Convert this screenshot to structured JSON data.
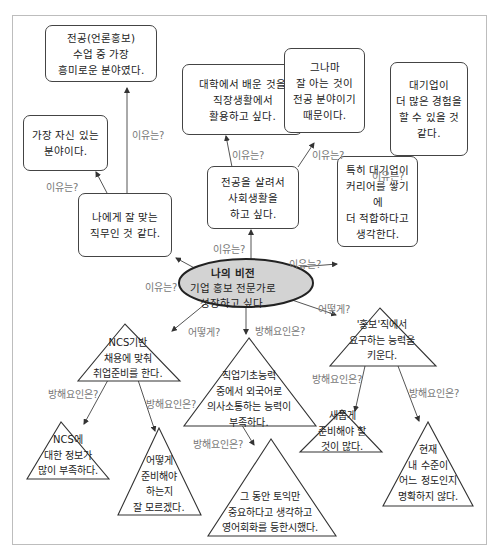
{
  "center": {
    "title": "나의 비전",
    "text": "기업 홍보 전문가로\n성장하고 싶다.",
    "fill": "#d3d3d3"
  },
  "labels": {
    "reason": "이유는?",
    "how": "어떻게?",
    "obstacle": "방해요인은?"
  },
  "reason_boxes": [
    {
      "id": "fit-job",
      "text": "나에게 잘 맞는\n직무인 것 같다."
    },
    {
      "id": "confident-field",
      "text": "가장 자신 있는\n분야이다."
    },
    {
      "id": "most-interesting",
      "text": "전공(언론홍보)\n수업 중 가장\n흥미로운 분야였다."
    },
    {
      "id": "use-major",
      "text": "전공을 살려서\n사회생활을\n하고 싶다."
    },
    {
      "id": "apply-learning",
      "text": "대학에서 배운 것을\n직장생활에서\n활용하고 싶다."
    },
    {
      "id": "know-major",
      "text": "그나마\n잘 아는 것이\n전공 분야이기\n때문이다."
    },
    {
      "id": "big-company",
      "text": "특히 대기업이\n커리어를 쌓기에\n더 적합하다고\n생각한다."
    },
    {
      "id": "more-experience",
      "text": "대기업이\n더 많은 경험을\n할 수 있을 것\n같다."
    }
  ],
  "how_triangles": [
    {
      "id": "ncs-prep",
      "text": "NCS기반\n채용에 맞춰\n취업준비를 한다."
    },
    {
      "id": "pr-skills",
      "text": "'홍보'직에서\n요구하는 능력을\n키운다."
    }
  ],
  "obstacle_triangles": [
    {
      "id": "ncs-info",
      "text": "NCS에\n대한 정보가\n많이 부족하다."
    },
    {
      "id": "dont-know",
      "text": "어떻게\n준비해야\n하는지\n잘 모르겠다."
    },
    {
      "id": "foreign-lang",
      "text": "직업기초능력\n중에서 외국어로\n의사소통하는 능력이\n부족하다."
    },
    {
      "id": "toeic-only",
      "text": "그 동안 토익만\n중요하다고 생각하고\n영어회화를 등한시했다."
    },
    {
      "id": "new-prep",
      "text": "새롭게\n준비해야 할\n것이 많다."
    },
    {
      "id": "level-unclear",
      "text": "현재\n내 수준이\n어느 정도인지\n명확하지 않다."
    }
  ]
}
